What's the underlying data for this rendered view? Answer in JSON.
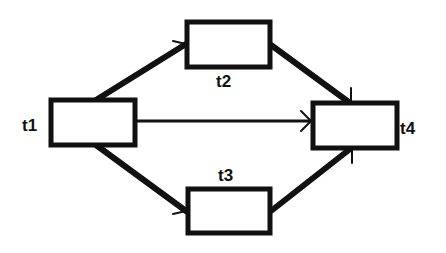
{
  "diagram": {
    "nodes": [
      {
        "id": "t1",
        "label": "t1",
        "x": 51,
        "y": 100,
        "w": 84,
        "h": 45,
        "label_x": 22,
        "label_y": 131
      },
      {
        "id": "t2",
        "label": "t2",
        "x": 187,
        "y": 22,
        "w": 83,
        "h": 45,
        "label_x": 216,
        "label_y": 87
      },
      {
        "id": "t3",
        "label": "t3",
        "x": 188,
        "y": 189,
        "w": 82,
        "h": 44,
        "label_x": 218,
        "label_y": 181
      },
      {
        "id": "t4",
        "label": "t4",
        "x": 313,
        "y": 103,
        "w": 84,
        "h": 45,
        "label_x": 400,
        "label_y": 134
      }
    ],
    "edges": [
      {
        "from": "t1",
        "to": "t2"
      },
      {
        "from": "t1",
        "to": "t4"
      },
      {
        "from": "t1",
        "to": "t3"
      },
      {
        "from": "t2",
        "to": "t4"
      },
      {
        "from": "t3",
        "to": "t4"
      }
    ],
    "colors": {
      "stroke": "#111111",
      "fill": "#ffffff"
    }
  }
}
